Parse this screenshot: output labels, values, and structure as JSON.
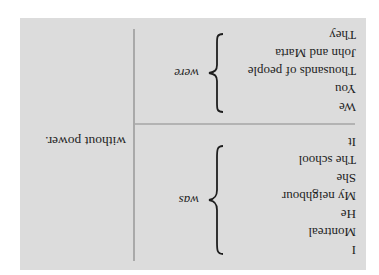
{
  "orientation": "rotated 180 degrees",
  "table": {
    "groups": [
      {
        "subjects": [
          "I",
          "Montreal",
          "He",
          "My neighbour",
          "She",
          "The school",
          "It"
        ],
        "verb": "was"
      },
      {
        "subjects": [
          "We",
          "You",
          "Thousands of people",
          "John and Marta",
          "They"
        ],
        "verb": "were"
      }
    ],
    "complement": "without power."
  },
  "colors": {
    "panel_bg": "#dcdcdc",
    "divider": "#a9a9a9",
    "text": "#1e1e1e"
  }
}
